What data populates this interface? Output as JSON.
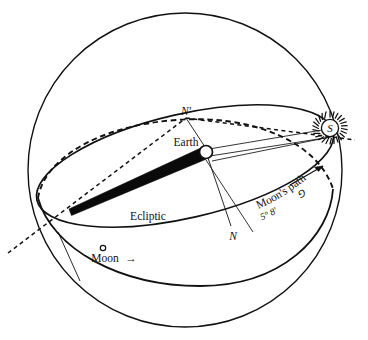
{
  "figure": {
    "background_color": "#ffffff",
    "ink_color": "#111111"
  },
  "labels": {
    "earth": "Earth",
    "ecliptic": "Ecliptic",
    "moon": "Moon",
    "moon_arrow": "→",
    "moons_path": "Moon's path",
    "inclination": "5° 8'",
    "inclination_symbol": "⅁",
    "node_ascending": "N",
    "node_descending": "N'",
    "sun": "S"
  },
  "elements": {
    "celestial_sphere": {
      "name": "celestial-sphere",
      "cx": 185,
      "cy": 170,
      "r": 157,
      "stroke_width": 1.4
    },
    "ecliptic_ellipse": {
      "name": "ecliptic-plane",
      "cx": 185,
      "cy": 166,
      "rx": 152,
      "ry": 52,
      "rotation_deg": -13,
      "stroke_width": 1.7
    },
    "moon_path_ellipse": {
      "name": "moon-orbit-plane",
      "cx": 185,
      "cy": 170,
      "rx": 152,
      "ry": 52,
      "rotation_deg": -8,
      "stroke_width": 1.7
    },
    "earth": {
      "name": "earth-body",
      "cx": 206,
      "cy": 152,
      "r": 6.5,
      "fill": "#ffffff",
      "stroke_width": 1.6
    },
    "sun": {
      "name": "sun-body",
      "cx": 330,
      "cy": 128,
      "r": 8.5,
      "spike_count": 26,
      "fill": "#ffffff",
      "stroke_width": 1.3
    },
    "moon": {
      "name": "moon-body",
      "cx": 103,
      "cy": 247,
      "r": 2.6,
      "fill": "#ffffff",
      "stroke_width": 1.2
    },
    "shadow_cone": {
      "name": "earth-shadow-cone",
      "fill": "#0a0a0a",
      "apex_x": 70,
      "apex_y": 211
    },
    "line_of_nodes": {
      "name": "line-of-nodes",
      "dash": "4 3.4",
      "stroke_width": 1.5
    }
  },
  "annotations": {
    "inclination_value_degrees": 5,
    "inclination_value_minutes": 8,
    "moon_direction": "eastward"
  }
}
